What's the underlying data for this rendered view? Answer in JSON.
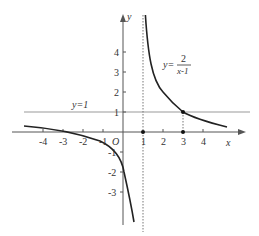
{
  "diagram": {
    "axes": {
      "x_label": "x",
      "y_label": "y",
      "origin_label": "O"
    },
    "x_ticks": [
      "-4",
      "-3",
      "-2",
      "-1",
      "1",
      "2",
      "3",
      "4"
    ],
    "y_ticks": [
      "4",
      "3",
      "2",
      "1",
      "-1",
      "-2",
      "-3"
    ],
    "function_label": {
      "lhs": "y=",
      "numerator": "2",
      "denominator": "x-1"
    },
    "asymptote_label": "y=1",
    "points": [
      {
        "x": 1,
        "y": 0
      },
      {
        "x": 3,
        "y": 0
      },
      {
        "x": 3,
        "y": 1
      }
    ],
    "colors": {
      "curve": "#222222",
      "axis": "#555555",
      "asymptote": "#999999"
    }
  }
}
